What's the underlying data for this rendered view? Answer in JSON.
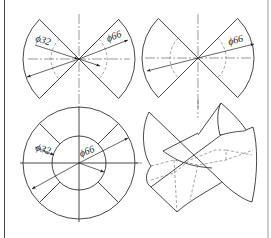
{
  "figure": {
    "views": [
      {
        "id": "view-top-left",
        "label": "two opposite sectors with two diameters",
        "dims": [
          "ϕ32",
          "ϕ66"
        ]
      },
      {
        "id": "view-top-right",
        "label": "two opposite sectors with one diameter",
        "dims": [
          "ϕ66"
        ]
      },
      {
        "id": "view-bottom-left",
        "label": "annulus divided into 8 segments",
        "dims": [
          "ϕ32",
          "ϕ66"
        ]
      },
      {
        "id": "view-bottom-right",
        "label": "isometric view of curved surfaces",
        "dims": []
      }
    ],
    "labels": {
      "tl_d32": "ϕ32",
      "tl_d66": "ϕ66",
      "tr_d66": "ϕ66",
      "bl_d32": "ϕ32",
      "bl_d66": "ϕ66"
    },
    "colors": {
      "line": "#333333",
      "background": "#ffffff"
    }
  }
}
